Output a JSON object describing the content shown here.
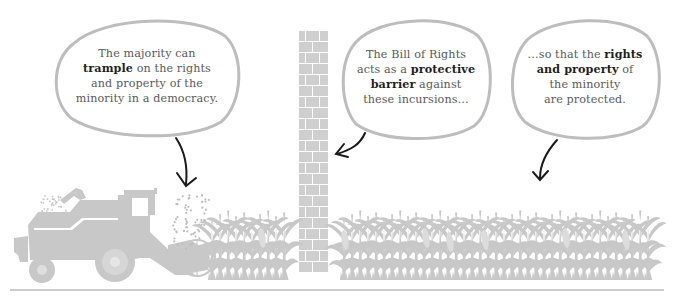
{
  "colors": {
    "illustration_gray": "#c8c8c8",
    "bubble_outline": "#bdbdbd",
    "arrow": "#1a1a1a",
    "text": "#5a5a5a",
    "bold_text": "#1f1f1f",
    "ground_line": "#9a9a9a"
  },
  "bubbles": [
    {
      "id": "majority",
      "segments": [
        {
          "text": "The majority can",
          "bold": false,
          "br": true
        },
        {
          "text": "trample",
          "bold": true
        },
        {
          "text": " on the rights",
          "bold": false,
          "br": true
        },
        {
          "text": "and property of the",
          "bold": false,
          "br": true
        },
        {
          "text": "minority in a democracy.",
          "bold": false
        }
      ]
    },
    {
      "id": "bill-of-rights",
      "segments": [
        {
          "text": "The Bill of Rights",
          "bold": false,
          "br": true
        },
        {
          "text": "acts as a ",
          "bold": false
        },
        {
          "text": "protective",
          "bold": true,
          "br": true
        },
        {
          "text": "barrier",
          "bold": true
        },
        {
          "text": " against",
          "bold": false,
          "br": true
        },
        {
          "text": "these incursions…",
          "bold": false
        }
      ]
    },
    {
      "id": "protected",
      "segments": [
        {
          "text": "…so that the ",
          "bold": false
        },
        {
          "text": "rights",
          "bold": true,
          "br": true
        },
        {
          "text": "and property",
          "bold": true
        },
        {
          "text": " of",
          "bold": false,
          "br": true
        },
        {
          "text": "the minority",
          "bold": false,
          "br": true
        },
        {
          "text": "are protected.",
          "bold": false
        }
      ]
    }
  ],
  "icons": {
    "combine": "combine-harvester-icon",
    "corn": "corn-stalk-icon",
    "wall": "brick-wall-icon",
    "arrow": "hand-drawn-arrow-icon"
  }
}
